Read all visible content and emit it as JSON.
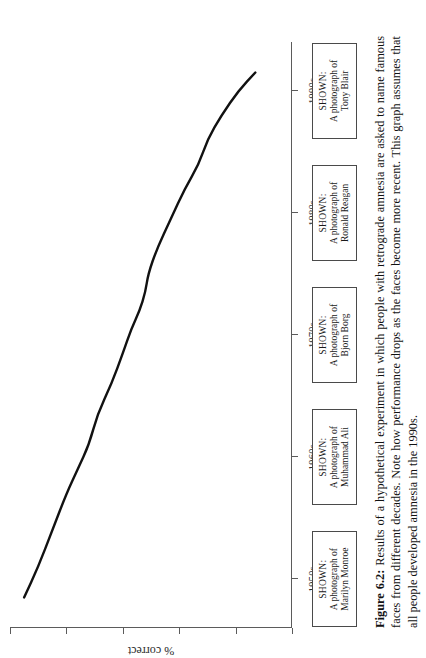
{
  "figure": {
    "caption_label": "Figure 6.2:",
    "caption_text": "Results of a hypothetical experiment in which people with retrograde amnesia are asked to name famous faces from different decades. Note how performance drops as the faces become more recent. This graph assumes that all people developed amnesia in the 1990s."
  },
  "shown_boxes": [
    {
      "label": "SHOWN:",
      "name": "A photograph of\nMarilyn Monroe"
    },
    {
      "label": "SHOWN:",
      "name": "A photograph of\nMuhammad Ali"
    },
    {
      "label": "SHOWN:",
      "name": "A photograph of\nBjorn Borg"
    },
    {
      "label": "SHOWN:",
      "name": "A photograph of\nRonald Reagan"
    },
    {
      "label": "SHOWN:",
      "name": "A photograph of\nTony Blair"
    }
  ],
  "chart_data": {
    "type": "line",
    "title": "",
    "xlabel": "",
    "ylabel": "% correct",
    "categories": [
      "1950s",
      "1960s",
      "1970s",
      "1980s",
      "1990s"
    ],
    "x": [
      1950,
      1960,
      1970,
      1980,
      1990
    ],
    "values": [
      92,
      74,
      58,
      40,
      16
    ],
    "series": [
      {
        "name": "% correct naming famous faces",
        "values": [
          92,
          74,
          58,
          40,
          16
        ]
      }
    ],
    "points": [
      {
        "x": 1948.5,
        "y": 95
      },
      {
        "x": 1951.0,
        "y": 90
      },
      {
        "x": 1954.0,
        "y": 85
      },
      {
        "x": 1957.0,
        "y": 80
      },
      {
        "x": 1959.0,
        "y": 76
      },
      {
        "x": 1961.0,
        "y": 72
      },
      {
        "x": 1963.5,
        "y": 69
      },
      {
        "x": 1966.0,
        "y": 64
      },
      {
        "x": 1968.5,
        "y": 60
      },
      {
        "x": 1970.5,
        "y": 57
      },
      {
        "x": 1972.0,
        "y": 54
      },
      {
        "x": 1973.5,
        "y": 52
      },
      {
        "x": 1975.0,
        "y": 51
      },
      {
        "x": 1977.0,
        "y": 48
      },
      {
        "x": 1979.5,
        "y": 43
      },
      {
        "x": 1982.0,
        "y": 38
      },
      {
        "x": 1984.0,
        "y": 33
      },
      {
        "x": 1986.0,
        "y": 30
      },
      {
        "x": 1988.0,
        "y": 25
      },
      {
        "x": 1990.0,
        "y": 19
      },
      {
        "x": 1991.5,
        "y": 13
      }
    ],
    "xlim": [
      1946,
      1994
    ],
    "ylim": [
      0,
      100
    ],
    "y_ticks": [
      0,
      20,
      40,
      60,
      80,
      100
    ],
    "grid": false,
    "legend": "none",
    "line_color": "#111111",
    "axis_color": "#5b5b5b"
  }
}
